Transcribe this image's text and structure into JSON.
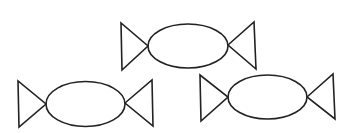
{
  "canvas": {
    "width": 355,
    "height": 133,
    "background": "#ffffff",
    "stroke_color": "#222222"
  },
  "candies": [
    {
      "name": "candy-top",
      "ellipse": {
        "cx": 188,
        "cy": 46,
        "rx": 40,
        "ry": 22
      },
      "left_wrapper": [
        [
          121,
          23
        ],
        [
          122,
          70
        ],
        [
          148,
          46
        ]
      ],
      "right_wrapper": [
        [
          228,
          45
        ],
        [
          254,
          22
        ],
        [
          256,
          69
        ]
      ]
    },
    {
      "name": "candy-bottom-left",
      "ellipse": {
        "cx": 85.5,
        "cy": 104,
        "rx": 39.5,
        "ry": 22.5
      },
      "left_wrapper": [
        [
          18,
          81
        ],
        [
          19,
          127
        ],
        [
          46,
          104
        ]
      ],
      "right_wrapper": [
        [
          125,
          103
        ],
        [
          152,
          80
        ],
        [
          153,
          126
        ]
      ]
    },
    {
      "name": "candy-bottom-right",
      "ellipse": {
        "cx": 267.5,
        "cy": 97,
        "rx": 39.5,
        "ry": 22
      },
      "left_wrapper": [
        [
          200,
          75
        ],
        [
          201,
          121
        ],
        [
          228,
          97
        ]
      ],
      "right_wrapper": [
        [
          307,
          97
        ],
        [
          333,
          74
        ],
        [
          335,
          119
        ]
      ]
    }
  ]
}
